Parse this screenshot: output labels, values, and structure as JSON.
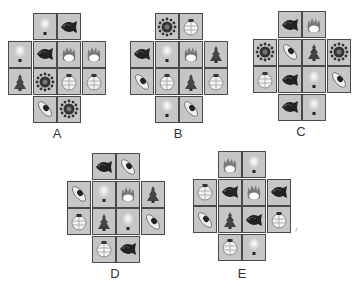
{
  "figure": {
    "options": [
      {
        "label": "A",
        "rows": [
          [
            null,
            "lightbulb",
            "fish",
            null
          ],
          [
            "lightbulb",
            "fish",
            "flame",
            "flame"
          ],
          [
            "tree",
            "sun",
            "lantern",
            "lantern"
          ],
          [
            null,
            "pod",
            "sun",
            null
          ]
        ]
      },
      {
        "label": "B",
        "rows": [
          [
            null,
            "sun",
            "lantern",
            null
          ],
          [
            "fish",
            "lightbulb",
            "flame",
            "tree"
          ],
          [
            "pod",
            "lantern",
            "tree",
            "lantern"
          ],
          [
            null,
            "lightbulb",
            "pod",
            null
          ]
        ]
      },
      {
        "label": "C",
        "rows": [
          [
            null,
            "fish",
            "flame",
            null
          ],
          [
            "sun",
            "pod",
            "tree",
            "sun"
          ],
          [
            "lantern",
            "fish",
            "lightbulb",
            "pod"
          ],
          [
            null,
            "fish",
            "lightbulb",
            null
          ]
        ]
      },
      {
        "label": "D",
        "rows": [
          [
            null,
            "fish",
            "pod",
            null
          ],
          [
            "pod",
            "lightbulb",
            "flame",
            "tree"
          ],
          [
            "lantern",
            "tree",
            "lightbulb",
            "pod"
          ],
          [
            null,
            "lantern",
            "fish",
            null
          ]
        ]
      },
      {
        "label": "E",
        "rows": [
          [
            null,
            "flame",
            "lightbulb",
            null
          ],
          [
            "lantern",
            "fish",
            "flame",
            "fish"
          ],
          [
            "pod",
            "tree",
            "fish",
            "lantern"
          ],
          [
            null,
            "lantern",
            "lightbulb",
            null
          ]
        ]
      }
    ]
  },
  "colors": {
    "cell": "#c6c6c6",
    "border": "#4a4a4a"
  }
}
